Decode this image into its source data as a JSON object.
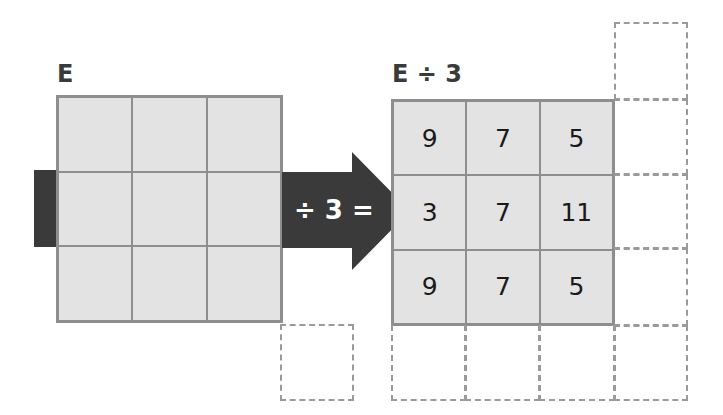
{
  "left_grid": {
    "label": "E",
    "cells": [
      "",
      "",
      "",
      "",
      "",
      "",
      "",
      "",
      ""
    ]
  },
  "operation": {
    "text": "÷ 3 =",
    "arrow_color": "#3a3a3a"
  },
  "right_grid": {
    "label": "E ÷ 3",
    "cells": [
      "9",
      "7",
      "5",
      "3",
      "7",
      "11",
      "9",
      "7",
      "5"
    ]
  },
  "colors": {
    "cell_fill": "#e3e3e3",
    "grid_line": "#8e8e8e",
    "dashed_line": "#9a9a9a",
    "dark": "#3a3a3a"
  }
}
